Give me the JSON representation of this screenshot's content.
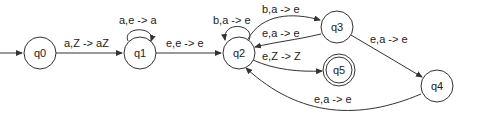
{
  "diagram": {
    "type": "pushdown-automaton",
    "states": [
      {
        "id": "q0",
        "label": "q0",
        "initial": true,
        "accepting": false
      },
      {
        "id": "q1",
        "label": "q1",
        "initial": false,
        "accepting": false
      },
      {
        "id": "q2",
        "label": "q2",
        "initial": false,
        "accepting": false
      },
      {
        "id": "q3",
        "label": "q3",
        "initial": false,
        "accepting": false
      },
      {
        "id": "q4",
        "label": "q4",
        "initial": false,
        "accepting": false
      },
      {
        "id": "q5",
        "label": "q5",
        "initial": false,
        "accepting": true
      }
    ],
    "transitions": [
      {
        "from": "q0",
        "to": "q1",
        "label": "a,Z -> aZ"
      },
      {
        "from": "q1",
        "to": "q1",
        "label": "a,e -> a"
      },
      {
        "from": "q1",
        "to": "q2",
        "label": "e,e -> e"
      },
      {
        "from": "q2",
        "to": "q2",
        "label": "b,a -> e"
      },
      {
        "from": "q2",
        "to": "q3",
        "label": "b,a -> e"
      },
      {
        "from": "q3",
        "to": "q2",
        "label": "e,a -> e"
      },
      {
        "from": "q2",
        "to": "q5",
        "label": "e,Z -> Z"
      },
      {
        "from": "q3",
        "to": "q4",
        "label": "e,a -> e"
      },
      {
        "from": "q4",
        "to": "q2",
        "label": "e,a -> e"
      }
    ]
  }
}
